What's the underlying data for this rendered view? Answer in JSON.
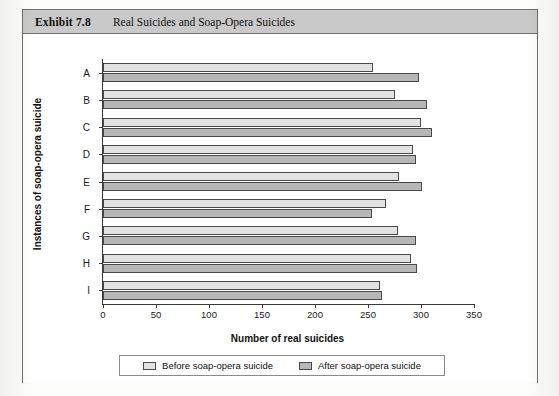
{
  "exhibit": {
    "number": "Exhibit 7.8",
    "title": "Real Suicides and Soap-Opera Suicides"
  },
  "chart_data": {
    "type": "bar",
    "orientation": "horizontal",
    "title": "Real Suicides and Soap-Opera Suicides",
    "xlabel": "Number of real suicides",
    "ylabel": "Instances of soap-opera suicide",
    "categories": [
      "A",
      "B",
      "C",
      "D",
      "E",
      "F",
      "G",
      "H",
      "I"
    ],
    "xlim": [
      0,
      350
    ],
    "xticks": [
      0,
      50,
      100,
      150,
      200,
      250,
      300,
      350
    ],
    "grid": false,
    "legend_position": "bottom",
    "series": [
      {
        "name": "Before soap-opera suicide",
        "color": "#e2e2e2",
        "values": [
          255,
          275,
          300,
          292,
          279,
          267,
          278,
          291,
          261
        ]
      },
      {
        "name": "After soap-opera suicide",
        "color": "#b7b7b7",
        "values": [
          298,
          306,
          310,
          295,
          301,
          254,
          295,
          296,
          263
        ]
      }
    ]
  },
  "legend": {
    "items": [
      {
        "label": "Before soap-opera suicide"
      },
      {
        "label": "After soap-opera suicide"
      }
    ]
  }
}
